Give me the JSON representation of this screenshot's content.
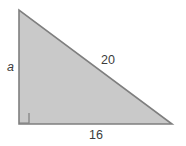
{
  "figure": {
    "kind": "right-triangle-diagram",
    "background_color": "#ffffff",
    "fill_color": "#c9c9c9",
    "stroke_color": "#7f7f7f",
    "text_color": "#3c3c3c",
    "vertices": {
      "apex": [
        19,
        10
      ],
      "right_angle": [
        19,
        124
      ],
      "base_right": [
        172,
        124
      ]
    },
    "right_angle_marker": {
      "present": true,
      "size": 10,
      "at_vertex": "right_angle"
    },
    "labels": {
      "vertical_leg": "a",
      "hypotenuse": "20",
      "horizontal_leg": "16"
    }
  }
}
